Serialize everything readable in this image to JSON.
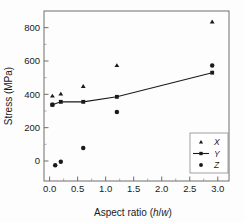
{
  "chart_data": {
    "type": "scatter",
    "title": "",
    "xlabel": "Aspect ratio (h/w)",
    "xlabel_parts": {
      "prefix": "Aspect ratio (",
      "italic1": "h",
      "slash": "/",
      "italic2": "w",
      "suffix": ")"
    },
    "ylabel": "Stress (MPa)",
    "xlim": [
      -0.1,
      3.2
    ],
    "ylim": [
      -120,
      900
    ],
    "xticks": [
      0.0,
      0.5,
      1.0,
      1.5,
      2.0,
      2.5,
      3.0
    ],
    "xticklabels": [
      "0.0",
      "0.5",
      "1.0",
      "1.5",
      "2.0",
      "2.5",
      "3.0"
    ],
    "yticks": [
      0,
      200,
      400,
      600,
      800
    ],
    "yticklabels": [
      "0",
      "200",
      "400",
      "600",
      "800"
    ],
    "grid": false,
    "legend_position": "lower right",
    "series": [
      {
        "name": "X",
        "marker": "triangle",
        "line": false,
        "color": "#1a1a1a",
        "x": [
          0.05,
          0.2,
          0.6,
          1.2,
          2.9
        ],
        "y": [
          390,
          402,
          448,
          573,
          835
        ]
      },
      {
        "name": "Y",
        "marker": "square",
        "line": true,
        "color": "#1a1a1a",
        "x": [
          0.05,
          0.2,
          0.6,
          1.2,
          2.9
        ],
        "y": [
          338,
          355,
          355,
          385,
          530
        ]
      },
      {
        "name": "Z",
        "marker": "circle",
        "line": false,
        "color": "#1a1a1a",
        "x": [
          0.05,
          0.1,
          0.2,
          0.6,
          1.2,
          2.9
        ],
        "y": [
          338,
          -25,
          -5,
          78,
          294,
          573
        ]
      }
    ]
  },
  "legend": {
    "entries": [
      {
        "label": "X",
        "marker": "triangle",
        "has_line": false
      },
      {
        "label": "Y",
        "marker": "square",
        "has_line": true
      },
      {
        "label": "Z",
        "marker": "circle",
        "has_line": false
      }
    ]
  }
}
